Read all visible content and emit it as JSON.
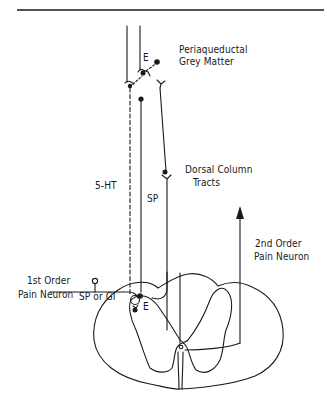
{
  "diagram": {
    "type": "neuroanatomy-pain-pathway",
    "colors": {
      "line": "#1a1a1a",
      "background": "#ffffff"
    },
    "labels": {
      "pag_line1": "Periaqueductal",
      "pag_line2": "Grey Matter",
      "e_top": "E",
      "serotonin": "5-HT",
      "sp_mid": "SP",
      "dorsal_line1": "Dorsal Column",
      "dorsal_line2": "Tracts",
      "second_line1": "2nd Order",
      "second_line2": "Pain Neuron",
      "first_line1": "1st Order",
      "first_line2": "Pain Neuron",
      "sp_or_gi": "SP or GI",
      "e_bottom": "E"
    },
    "elements": [
      "descending-serotonergic-fiber-dashed",
      "substance-p-ascending-fiber",
      "dorsal-column-tract",
      "second-order-ascending-arrow",
      "first-order-afferent",
      "enkephalin-interneuron-top",
      "enkephalin-interneuron-bottom",
      "spinal-cord-cross-section"
    ]
  }
}
